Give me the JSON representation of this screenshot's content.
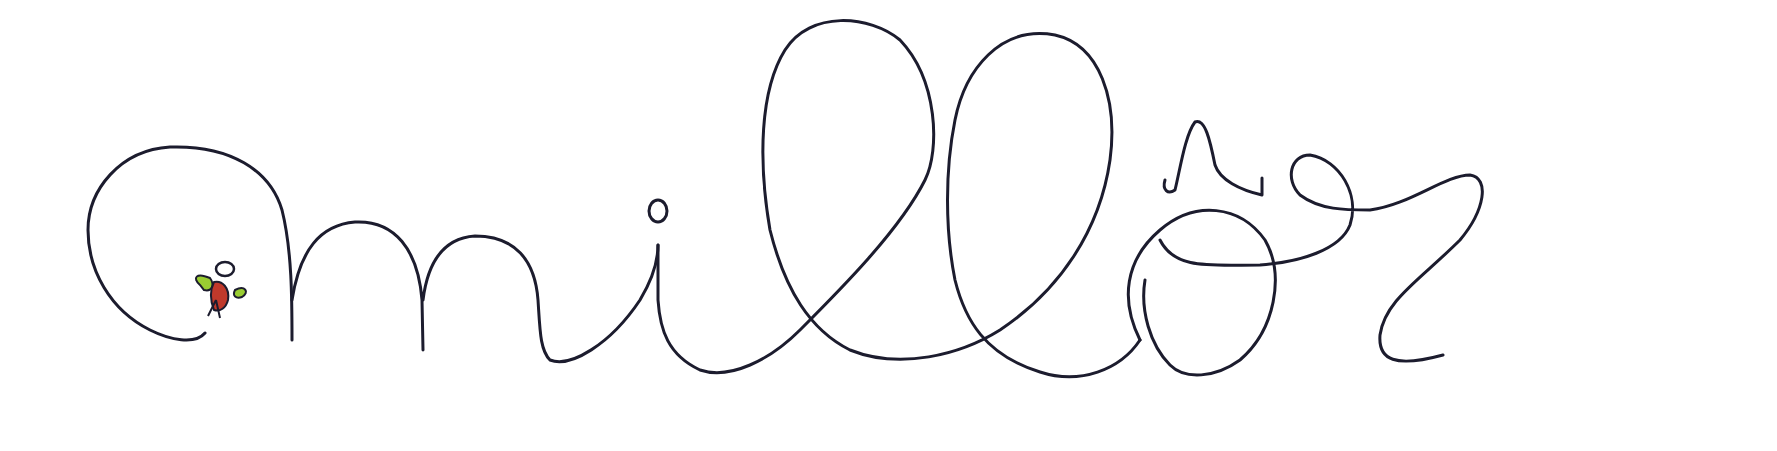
{
  "image": {
    "type": "handwritten-signature",
    "text": "millôr",
    "ink_color": "#1c1c2e",
    "background": "#ffffff",
    "figure": {
      "name": "angel-figure",
      "colors": {
        "halo": "#1c1c2e",
        "body": "#c0392b",
        "wings": "#9acd32"
      }
    }
  }
}
